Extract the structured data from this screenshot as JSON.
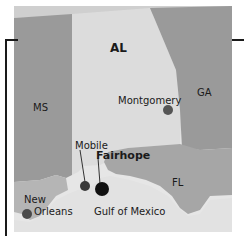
{
  "map": {
    "states": [
      {
        "label": "AL",
        "fill": "#dcdcdc"
      },
      {
        "label": "MS",
        "fill": "#9a9a9a"
      },
      {
        "label": "GA",
        "fill": "#9a9a9a"
      },
      {
        "label": "FL",
        "fill": "#a6a6a6"
      }
    ],
    "water": {
      "label": "Gulf of Mexico",
      "fill": "#e4e4e4"
    },
    "cities": [
      {
        "label": "Montgomery",
        "marker_color": "#555555"
      },
      {
        "label": "Mobile",
        "marker_color": "#3a3a3a"
      },
      {
        "label": "Fairhope",
        "marker_color": "#111111",
        "highlighted": true
      },
      {
        "label": "New Orleans",
        "label_line1": "New",
        "label_line2": "Orleans",
        "marker_color": "#4a4a4a"
      }
    ]
  }
}
